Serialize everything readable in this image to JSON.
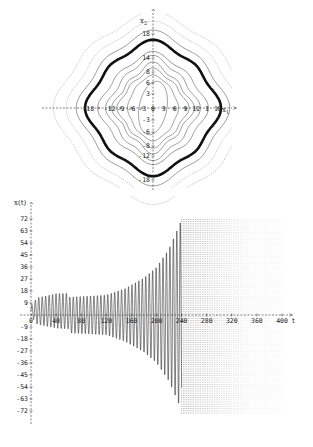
{
  "chart_data": [
    {
      "type": "line",
      "subtype": "phase-portrait",
      "title": "",
      "xlabel": "x1",
      "ylabel": "x2",
      "xlim": [
        -18,
        18
      ],
      "ylim": [
        -18,
        18
      ],
      "x_ticks": [
        -18,
        -12,
        -9,
        -6,
        -3,
        0,
        3,
        6,
        9,
        12,
        15,
        18
      ],
      "x_tick_labels": [
        "-18",
        "-15",
        "-12",
        "-9",
        "-6",
        "-3",
        "0",
        "3",
        "6",
        "9",
        "12",
        "1",
        "18"
      ],
      "y_ticks": [
        18,
        14,
        8,
        6,
        3,
        -3,
        -6,
        -8,
        -12,
        -18
      ],
      "y_tick_labels": [
        "18",
        "14",
        "8",
        "6",
        "3",
        "-3",
        "-6",
        "-8",
        "-12",
        "-18"
      ],
      "description": "Nested closed wavy orbits around the origin; a thick dark orbit near radius ~15 (x1) / ~13 (x2); inner egg-shaped orbit tilted; outer open dotted trajectories.",
      "series": [
        {
          "name": "inner orbit",
          "rx": 3.5,
          "ry": 6,
          "wave": 0
        },
        {
          "name": "orbit 2",
          "rx": 6,
          "ry": 7,
          "wave": 0.6
        },
        {
          "name": "orbit 3",
          "rx": 8,
          "ry": 8,
          "wave": 1.2
        },
        {
          "name": "orbit 4",
          "rx": 9,
          "ry": 9,
          "wave": 1.4
        },
        {
          "name": "orbit 5",
          "rx": 10.5,
          "ry": 10.5,
          "wave": 1.2
        },
        {
          "name": "orbit 6",
          "rx": 12.5,
          "ry": 11.5,
          "wave": 1.0
        },
        {
          "name": "limit cycle (thick)",
          "rx": 15.5,
          "ry": 14,
          "wave": 0.9
        },
        {
          "name": "orbit 8",
          "rx": 17.5,
          "ry": 16,
          "wave": 0.9
        },
        {
          "name": "outer 1",
          "rx": 20,
          "ry": 18,
          "wave": 0.8
        },
        {
          "name": "outer 2",
          "rx": 23,
          "ry": 20,
          "wave": 0.8
        }
      ],
      "grid": false,
      "legend": null
    },
    {
      "type": "line",
      "subtype": "time-series",
      "title": "",
      "xlabel": "t",
      "ylabel": "x(t)",
      "xlim": [
        0,
        400
      ],
      "ylim": [
        -72,
        72
      ],
      "x_ticks": [
        0,
        40,
        80,
        120,
        160,
        200,
        240,
        280,
        320,
        360,
        400
      ],
      "x_tick_labels": [
        "0",
        "40",
        "80",
        "120",
        "160",
        "200",
        "240",
        "280",
        "320",
        "360",
        "400"
      ],
      "y_ticks": [
        72,
        63,
        54,
        45,
        36,
        27,
        18,
        9,
        -9,
        -18,
        -27,
        -36,
        -45,
        -54,
        -63,
        -72
      ],
      "y_tick_labels": [
        "72",
        "63",
        "54",
        "45",
        "36",
        "27",
        "18",
        "9",
        "-9",
        "-18",
        "-27",
        "-36",
        "-45",
        "-54",
        "-63",
        "-72"
      ],
      "envelope": {
        "t": [
          0,
          10,
          40,
          80,
          120,
          150,
          180,
          200,
          220,
          240,
          260,
          400
        ],
        "amplitude": [
          4,
          10,
          13,
          14,
          15,
          20,
          28,
          36,
          50,
          72,
          72,
          72
        ]
      },
      "oscillation_period": 5.5,
      "description": "Oscillation with growing amplitude; after t~240 the signal exceeds the plotted range and appears as dense dotted vertical lines clipped at +/-72 up to t~400.",
      "grid": false,
      "legend": null
    }
  ]
}
